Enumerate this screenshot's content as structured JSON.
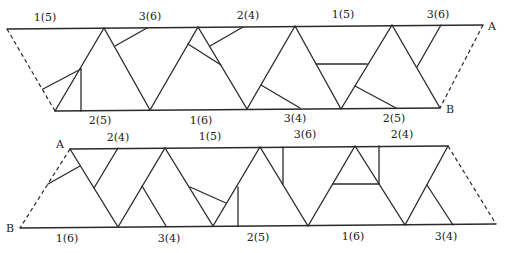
{
  "top_strip": {
    "top_labels": [
      "1(5)",
      "3(6)",
      "2(4)",
      "1(5)",
      "3(6)"
    ],
    "bottom_labels": [
      "2(5)",
      "1(6)",
      "3(4)",
      "2(5)"
    ],
    "point_a": "A",
    "point_b": "B"
  },
  "bottom_strip": {
    "top_labels": [
      "2(4)",
      "1(5)",
      "3(6)",
      "2(4)"
    ],
    "bottom_labels": [
      "1(6)",
      "3(4)",
      "2(5)",
      "1(6)",
      "3(4)"
    ],
    "point_a": "A",
    "point_b": "B"
  }
}
